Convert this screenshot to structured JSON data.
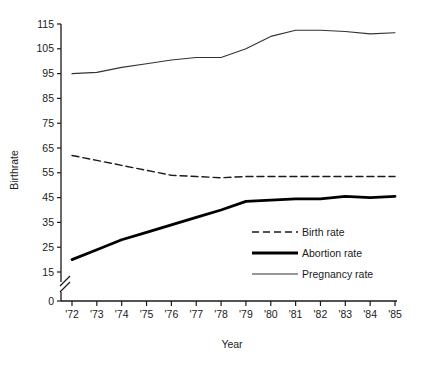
{
  "chart_data": {
    "type": "line",
    "title": "",
    "xlabel": "Year",
    "ylabel": "Birthrate",
    "x": [
      "'72",
      "'73",
      "'74",
      "'75",
      "'76",
      "'77",
      "'78",
      "'79",
      "'80",
      "'81",
      "'82",
      "'83",
      "'84",
      "'85"
    ],
    "xtick_labels": [
      "'72",
      "'73",
      "'74",
      "'75",
      "'76",
      "'77",
      "'78",
      "'79",
      "'80",
      "'81",
      "'82",
      "'83",
      "'84",
      "'85"
    ],
    "ytick_labels": [
      "0",
      "15",
      "25",
      "35",
      "45",
      "55",
      "65",
      "75",
      "85",
      "95",
      "105",
      "115"
    ],
    "ytick_values": [
      0,
      15,
      25,
      35,
      45,
      55,
      65,
      75,
      85,
      95,
      105,
      115
    ],
    "ylim": [
      15,
      115
    ],
    "axis_break": true,
    "axis_break_note": "broken y-axis between 0 and 15",
    "grid": false,
    "legend_position": "center-right",
    "series": [
      {
        "name": "Birth rate",
        "style": "dashed",
        "color": "#1a1a1a",
        "width": 1.4,
        "values": [
          62,
          60,
          58,
          56,
          54,
          53.5,
          53,
          53.5,
          53.5,
          53.5,
          53.5,
          53.5,
          53.5,
          53.5
        ]
      },
      {
        "name": "Abortion rate",
        "style": "solid-thick",
        "color": "#000000",
        "width": 2.8,
        "values": [
          20,
          24,
          28,
          31,
          34,
          37,
          40,
          43.5,
          44,
          44.5,
          44.5,
          45.5,
          45,
          45.5
        ]
      },
      {
        "name": "Pregnancy rate",
        "style": "solid-thin",
        "color": "#333333",
        "width": 1.1,
        "values": [
          95,
          95.5,
          97.5,
          99,
          100.5,
          101.5,
          101.5,
          105,
          110,
          112.5,
          112.5,
          112,
          111,
          111.5
        ]
      }
    ]
  },
  "legend": {
    "items": [
      {
        "label": "Birth rate"
      },
      {
        "label": "Abortion rate"
      },
      {
        "label": "Pregnancy rate"
      }
    ]
  },
  "axes": {
    "y_title": "Birthrate",
    "x_title": "Year"
  }
}
